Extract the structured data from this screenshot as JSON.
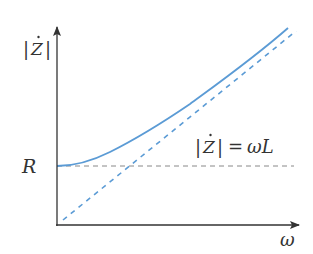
{
  "diagram": {
    "type": "impedance-frequency plot",
    "y_axis_label": {
      "bar_left": "|",
      "symbol": "Z",
      "dot": "·",
      "bar_right": "|"
    },
    "x_axis_label": "ω",
    "r_label": "R",
    "asymptote_label": {
      "lhs_bar_left": "|",
      "lhs_symbol": "Z",
      "lhs_bar_right": "|",
      "equals": "=",
      "rhs": "ωL"
    },
    "colors": {
      "axes": "#333333",
      "curve": "#5b9bd5",
      "asymptote": "#5b9bd5",
      "r_level": "#888888",
      "text": "#333333"
    },
    "curves": [
      {
        "name": "impedance-magnitude",
        "formula": "|Z| = sqrt(R^2 + (ωL)^2)",
        "style": "solid"
      },
      {
        "name": "inductive-asymptote",
        "formula": "|Z| = ωL",
        "style": "dashed"
      },
      {
        "name": "resistance-level",
        "formula": "|Z| = R",
        "style": "dashed"
      }
    ]
  }
}
